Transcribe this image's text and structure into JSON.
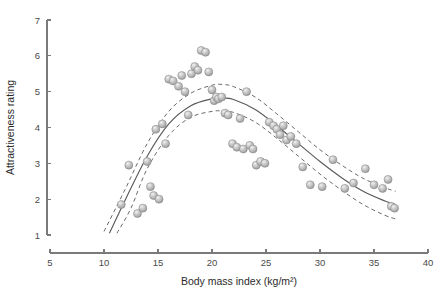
{
  "chart_data": {
    "type": "scatter",
    "title": "",
    "xlabel": "Body mass index (kg/m²)",
    "ylabel": "Attractiveness rating",
    "xlim": [
      5,
      40
    ],
    "ylim": [
      1,
      7
    ],
    "xticks": [
      5,
      10,
      15,
      20,
      25,
      30,
      35,
      40
    ],
    "xtick_labels": [
      "5",
      "10",
      "15",
      "20",
      "25",
      "30",
      "35",
      "40"
    ],
    "yticks": [
      1,
      2,
      3,
      4,
      5,
      6,
      7
    ],
    "ytick_labels": [
      "1",
      "2",
      "3",
      "4",
      "5",
      "6",
      "7"
    ],
    "grid": false,
    "legend": false,
    "marker_style": "sphere",
    "marker_color": "#b4b4b4",
    "marker_edge_color": "#8c8c8c",
    "points": [
      [
        11.6,
        1.85
      ],
      [
        12.3,
        2.95
      ],
      [
        13.1,
        1.6
      ],
      [
        13.6,
        1.75
      ],
      [
        14.0,
        3.05
      ],
      [
        14.3,
        2.35
      ],
      [
        14.6,
        2.1
      ],
      [
        14.8,
        3.95
      ],
      [
        15.1,
        2.0
      ],
      [
        15.4,
        4.1
      ],
      [
        15.7,
        3.55
      ],
      [
        16.0,
        5.35
      ],
      [
        16.4,
        5.3
      ],
      [
        16.9,
        5.15
      ],
      [
        17.2,
        5.45
      ],
      [
        17.5,
        5.0
      ],
      [
        17.8,
        4.35
      ],
      [
        18.1,
        5.5
      ],
      [
        18.4,
        5.7
      ],
      [
        18.7,
        5.6
      ],
      [
        19.0,
        6.15
      ],
      [
        19.4,
        6.1
      ],
      [
        19.7,
        5.55
      ],
      [
        20.0,
        5.05
      ],
      [
        20.2,
        4.75
      ],
      [
        20.4,
        4.85
      ],
      [
        20.6,
        4.8
      ],
      [
        20.9,
        4.85
      ],
      [
        21.2,
        4.4
      ],
      [
        21.5,
        4.35
      ],
      [
        21.9,
        3.55
      ],
      [
        22.3,
        3.45
      ],
      [
        22.6,
        4.25
      ],
      [
        22.9,
        3.4
      ],
      [
        23.2,
        5.0
      ],
      [
        23.5,
        3.5
      ],
      [
        23.8,
        3.4
      ],
      [
        24.1,
        2.95
      ],
      [
        24.5,
        3.05
      ],
      [
        24.9,
        3.0
      ],
      [
        25.3,
        4.15
      ],
      [
        25.7,
        4.05
      ],
      [
        26.0,
        3.95
      ],
      [
        26.3,
        3.8
      ],
      [
        26.6,
        4.05
      ],
      [
        26.9,
        3.65
      ],
      [
        27.3,
        3.75
      ],
      [
        27.8,
        3.55
      ],
      [
        28.4,
        2.9
      ],
      [
        29.1,
        2.4
      ],
      [
        30.2,
        2.35
      ],
      [
        31.2,
        3.1
      ],
      [
        32.3,
        2.3
      ],
      [
        33.1,
        2.45
      ],
      [
        34.2,
        2.85
      ],
      [
        35.0,
        2.4
      ],
      [
        35.8,
        2.3
      ],
      [
        36.3,
        2.55
      ],
      [
        36.6,
        1.8
      ],
      [
        36.9,
        1.75
      ]
    ],
    "fit_curve": {
      "name": "fitted curve",
      "style": "solid",
      "x": [
        10.5,
        12,
        14,
        16,
        18,
        20,
        21,
        22,
        24,
        26,
        28,
        30,
        32,
        34,
        36,
        37
      ],
      "y": [
        1.05,
        2.0,
        3.2,
        4.1,
        4.6,
        4.8,
        4.82,
        4.78,
        4.5,
        4.05,
        3.55,
        3.05,
        2.6,
        2.22,
        1.95,
        1.85
      ]
    },
    "confidence_upper": {
      "name": "upper confidence band",
      "style": "dashed",
      "x": [
        10.0,
        12,
        14,
        16,
        18,
        20,
        21,
        22,
        24,
        26,
        28,
        30,
        32,
        34,
        36,
        37
      ],
      "y": [
        1.1,
        2.3,
        3.55,
        4.45,
        4.95,
        5.18,
        5.2,
        5.14,
        4.85,
        4.38,
        3.88,
        3.38,
        2.95,
        2.58,
        2.32,
        2.22
      ]
    },
    "confidence_lower": {
      "name": "lower confidence band",
      "style": "dashed",
      "x": [
        11.2,
        12.5,
        14,
        16,
        18,
        20,
        21,
        22,
        24,
        26,
        28,
        30,
        32,
        34,
        36,
        37
      ],
      "y": [
        1.05,
        1.75,
        2.85,
        3.78,
        4.28,
        4.45,
        4.46,
        4.42,
        4.15,
        3.7,
        3.2,
        2.7,
        2.25,
        1.85,
        1.55,
        1.45
      ]
    }
  }
}
